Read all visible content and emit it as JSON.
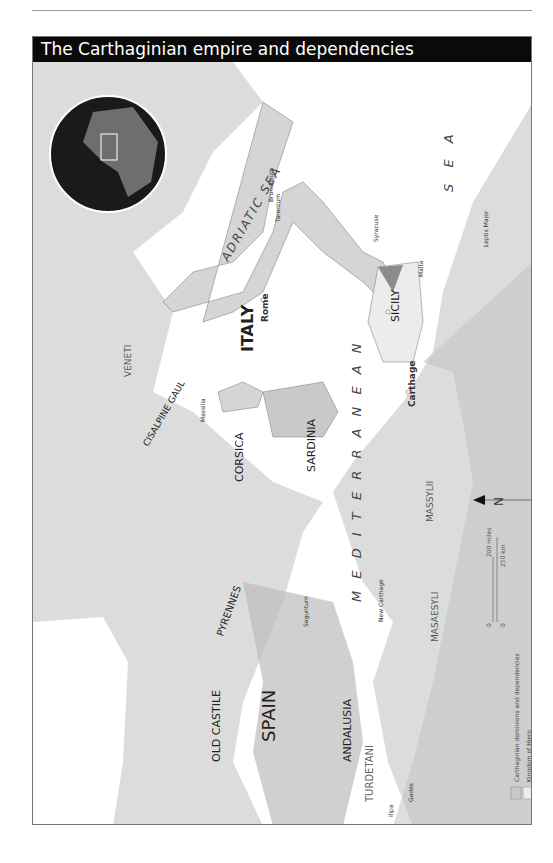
{
  "title": "The Carthaginian empire and dependencies",
  "regions": {
    "italy": "ITALY",
    "sicily": "SICILY",
    "sardinia": "SARDINIA",
    "corsica": "CORSICA",
    "spain": "SPAIN",
    "old_castile": "OLD CASTILE",
    "andalusia": "ANDALUSIA",
    "turdetani": "TURDETANI",
    "pyrennes": "PYRENNES",
    "cisalpine_gaul": "CISALPINE GAUL",
    "veneti": "VENETI",
    "massylii": "MASSYLII",
    "masaesyli": "MASAESYLI"
  },
  "seas": {
    "adriatic": "ADRIATIC SEA",
    "mediterranean": "M E D I T E R R A N E A N",
    "sea": "S E A"
  },
  "cities": [
    {
      "name": "Brundisium"
    },
    {
      "name": "Tarentum"
    },
    {
      "name": "Thurii"
    },
    {
      "name": "Petelia"
    },
    {
      "name": "Croton"
    },
    {
      "name": "Caulonia"
    },
    {
      "name": "Locri"
    },
    {
      "name": "Rhegium"
    },
    {
      "name": "Consentia"
    },
    {
      "name": "Syracuse"
    },
    {
      "name": "Salapia"
    },
    {
      "name": "Arpi"
    },
    {
      "name": "Casilinum"
    },
    {
      "name": "Capua"
    },
    {
      "name": "Neapolis"
    },
    {
      "name": "Rome"
    },
    {
      "name": "Spoletium"
    },
    {
      "name": "Ariminum"
    },
    {
      "name": "Agylla"
    },
    {
      "name": "Cosa"
    },
    {
      "name": "Crotona"
    },
    {
      "name": "Pisae"
    },
    {
      "name": "Elba"
    },
    {
      "name": "Aleria"
    },
    {
      "name": "Genoa"
    },
    {
      "name": "Caralis"
    },
    {
      "name": "Sulci"
    },
    {
      "name": "Liparean Is"
    },
    {
      "name": "Eryx"
    },
    {
      "name": "Panormus"
    },
    {
      "name": "Lilybaeum"
    },
    {
      "name": "Drepana"
    },
    {
      "name": "Aegates Is"
    },
    {
      "name": "Heraclea"
    },
    {
      "name": "Camarina"
    },
    {
      "name": "Hermaeum Pt"
    },
    {
      "name": "Pantelleria"
    },
    {
      "name": "Clupea"
    },
    {
      "name": "Gozo"
    },
    {
      "name": "Malta"
    },
    {
      "name": "Cape Farina"
    },
    {
      "name": "Utica"
    },
    {
      "name": "Carthage"
    },
    {
      "name": "Hadrumetum"
    },
    {
      "name": "Leptis Minor"
    },
    {
      "name": "Thapsus"
    },
    {
      "name": "Zama"
    },
    {
      "name": "Sicca"
    },
    {
      "name": "Hippo Acra"
    },
    {
      "name": "Castra Cornelia"
    },
    {
      "name": "Thugga"
    },
    {
      "name": "Abba"
    },
    {
      "name": "Souk el Kemis"
    },
    {
      "name": "Hippo Regius"
    },
    {
      "name": "Cirta"
    },
    {
      "name": "Syrtis Minor"
    },
    {
      "name": "Leptis Major"
    },
    {
      "name": "Massilia"
    },
    {
      "name": "Avignon"
    },
    {
      "name": "Forgues"
    },
    {
      "name": "Illiberis"
    },
    {
      "name": "Emporiae"
    },
    {
      "name": "Barcino"
    },
    {
      "name": "Subur"
    },
    {
      "name": "Tarraco"
    },
    {
      "name": "Dertosa"
    },
    {
      "name": "Ilitergi"
    },
    {
      "name": "Saguntum"
    },
    {
      "name": "Minor (Minorca)"
    },
    {
      "name": "Major (Majorca)"
    },
    {
      "name": "Balearic Is"
    },
    {
      "name": "Cape Nao"
    },
    {
      "name": "Acra Leuce"
    },
    {
      "name": "Cape Palos"
    },
    {
      "name": "New Carthage"
    },
    {
      "name": "Castulo"
    },
    {
      "name": "Baecula"
    },
    {
      "name": "Ilurgia"
    },
    {
      "name": "Toletum"
    },
    {
      "name": "Numantia"
    },
    {
      "name": "Salmantica"
    },
    {
      "name": "Italica"
    },
    {
      "name": "Ilipa"
    },
    {
      "name": "Gades"
    },
    {
      "name": "Tingis"
    },
    {
      "name": "Lixus"
    },
    {
      "name": "Sololis"
    }
  ],
  "rivers": [
    "Tiber",
    "Arno",
    "Rhone",
    "Durance",
    "Isère",
    "Loire",
    "Dordogne",
    "Ebro",
    "Sucro",
    "Segura",
    "Tagus",
    "Guadiana",
    "Guadalquivir",
    "Douro",
    "Bagradas",
    "Moluchath"
  ],
  "compass": {
    "label": "N"
  },
  "scale": {
    "miles_zero": "0",
    "miles_max": "200 miles",
    "km_zero": "0",
    "km_max": "250 km"
  },
  "legend": {
    "items": [
      {
        "label": "Carthaginian dominions and dependencies",
        "color": "#c9c9c9"
      },
      {
        "label": "Kingdom of Hiero",
        "color": "#ececec"
      },
      {
        "label": "Mamertini",
        "color": "#8c8c8c"
      }
    ]
  },
  "colors": {
    "land": "#d7d7d7",
    "carthaginian": "#bdbdbd",
    "sea": "#ffffff",
    "title_bg": "#0a0a0a",
    "globe": "#1a1a1a"
  }
}
